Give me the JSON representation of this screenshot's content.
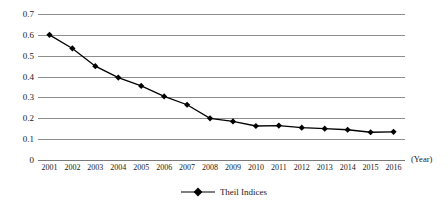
{
  "chart_data": {
    "type": "line",
    "title": "",
    "xlabel": "(Year)",
    "ylabel": "",
    "categories": [
      "2001",
      "2002",
      "2003",
      "2004",
      "2005",
      "2006",
      "2007",
      "2008",
      "2009",
      "2010",
      "2011",
      "2012",
      "2013",
      "2014",
      "2015",
      "2016"
    ],
    "series": [
      {
        "name": "Theil Indices",
        "values": [
          0.6,
          0.535,
          0.45,
          0.395,
          0.355,
          0.305,
          0.265,
          0.2,
          0.185,
          0.163,
          0.165,
          0.155,
          0.15,
          0.145,
          0.133,
          0.135
        ]
      }
    ],
    "ylim": [
      0,
      0.7
    ],
    "ytick_values": [
      0.7,
      0.6,
      0.5,
      0.4,
      0.3,
      0.2,
      0.1,
      0
    ],
    "ytick_labels": [
      "0.7",
      "0.6",
      "0.5",
      "0.4",
      "0.3",
      "0.2",
      "0.1",
      "0"
    ],
    "grid": "horizontal",
    "legend_position": "bottom",
    "marker": "diamond",
    "series_color": "#000000",
    "grid_color": "#8d8d8d"
  },
  "legend": {
    "label": "Theil Indices"
  },
  "axes": {
    "x_title": "(Year)"
  }
}
